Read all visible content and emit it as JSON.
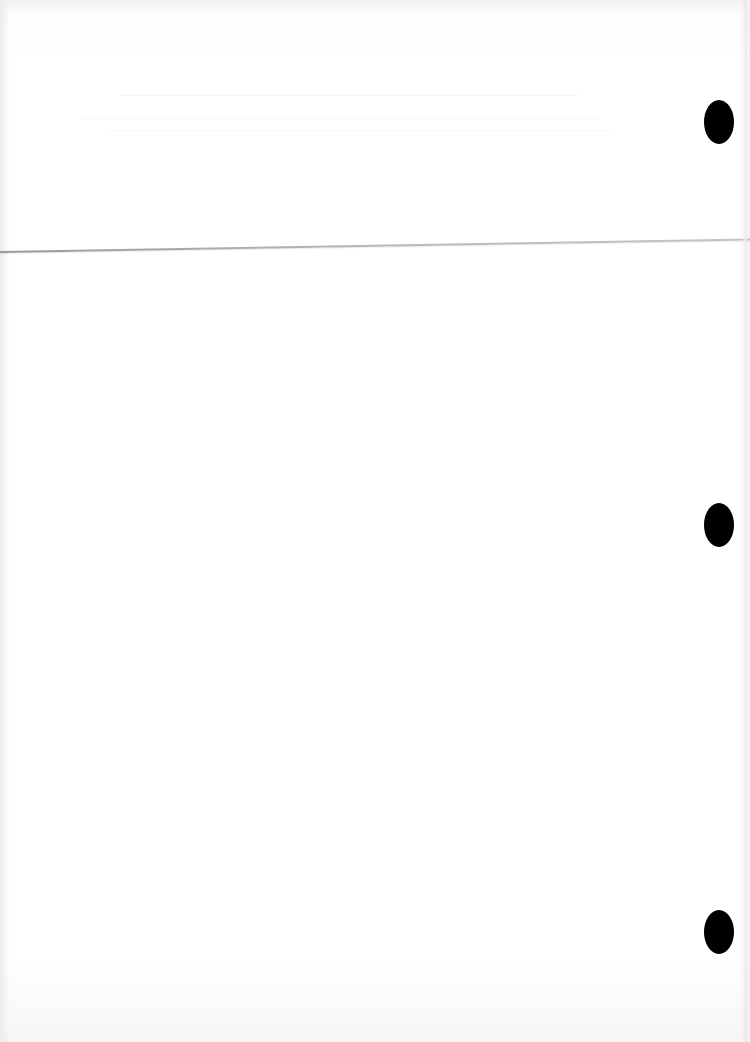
{
  "document": {
    "type": "scanned-blank-page",
    "visible_text": "",
    "background_color": "#ffffff",
    "crease_color": "#a8a8a8",
    "punch_hole_color": "#000000",
    "punch_holes": [
      {
        "label": "top-hole",
        "x": 704,
        "y": 100
      },
      {
        "label": "middle-hole",
        "x": 704,
        "y": 503
      },
      {
        "label": "bottom-hole",
        "x": 704,
        "y": 910
      }
    ]
  }
}
